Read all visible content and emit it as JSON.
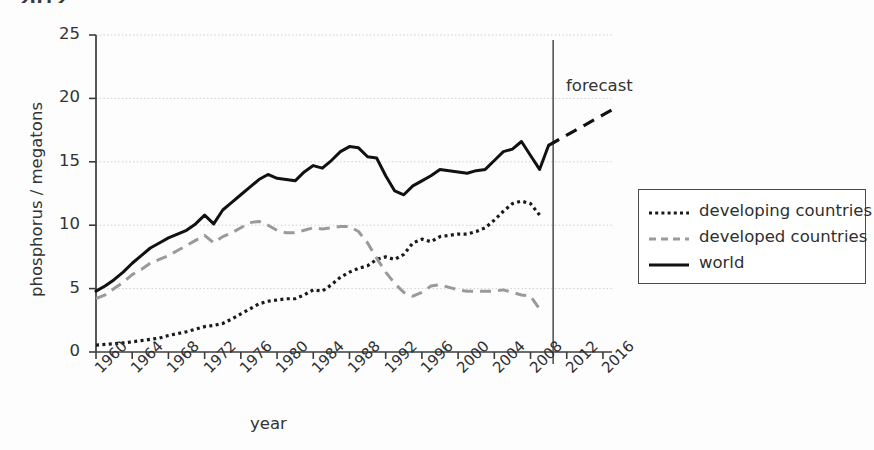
{
  "caption_fragment": "2012.",
  "legend": {
    "position": "right",
    "entries": [
      {
        "label": "developing countries",
        "style": "dotted",
        "color": "#1a1a1a"
      },
      {
        "label": "developed countries",
        "style": "dashed",
        "color": "#9a9a9a"
      },
      {
        "label": "world",
        "style": "solid",
        "color": "#111111"
      }
    ]
  },
  "annotations": [
    {
      "name": "forecast",
      "text": "forecast",
      "x_year": 2010.5
    }
  ],
  "chart_data": {
    "type": "line",
    "title": "",
    "xlabel": "year",
    "ylabel": "phosphorus / megatons",
    "xlim": [
      1960,
      2017
    ],
    "ylim": [
      0,
      25
    ],
    "yticks": [
      0,
      5,
      10,
      15,
      20,
      25
    ],
    "xticks": [
      1960,
      1964,
      1968,
      1972,
      1976,
      1980,
      1984,
      1988,
      1992,
      1996,
      2000,
      2004,
      2008,
      2012,
      2016
    ],
    "grid": "horizontal",
    "forecast_divider_year": 2010.5,
    "x": [
      1960,
      1961,
      1962,
      1963,
      1964,
      1965,
      1966,
      1967,
      1968,
      1969,
      1970,
      1971,
      1972,
      1973,
      1974,
      1975,
      1976,
      1977,
      1978,
      1979,
      1980,
      1981,
      1982,
      1983,
      1984,
      1985,
      1986,
      1987,
      1988,
      1989,
      1990,
      1991,
      1992,
      1993,
      1994,
      1995,
      1996,
      1997,
      1998,
      1999,
      2000,
      2001,
      2002,
      2003,
      2004,
      2005,
      2006,
      2007,
      2008,
      2009,
      2010
    ],
    "series": [
      {
        "name": "world",
        "style": "solid",
        "color": "#111111",
        "values": [
          4.8,
          5.2,
          5.7,
          6.3,
          7.0,
          7.6,
          8.2,
          8.6,
          9.0,
          9.3,
          9.6,
          10.1,
          10.8,
          10.1,
          11.2,
          11.8,
          12.4,
          13.0,
          13.6,
          14.0,
          13.7,
          13.6,
          13.5,
          14.2,
          14.7,
          14.5,
          15.1,
          15.8,
          16.2,
          16.1,
          15.4,
          15.3,
          13.9,
          12.7,
          12.4,
          13.1,
          13.5,
          13.9,
          14.4,
          14.3,
          14.2,
          14.1,
          14.3,
          14.4,
          15.1,
          15.8,
          16.0,
          16.6,
          15.5,
          14.4,
          16.3
        ],
        "forecast_x": [
          2010,
          2011,
          2012,
          2013,
          2014,
          2015,
          2016,
          2017
        ],
        "forecast_values": [
          16.3,
          16.7,
          17.1,
          17.5,
          17.9,
          18.3,
          18.7,
          19.1
        ]
      },
      {
        "name": "developed countries",
        "style": "dashed",
        "color": "#9a9a9a",
        "values": [
          4.2,
          4.5,
          5.0,
          5.5,
          6.1,
          6.5,
          7.0,
          7.3,
          7.6,
          8.0,
          8.4,
          8.8,
          9.2,
          8.6,
          9.1,
          9.4,
          9.8,
          10.2,
          10.3,
          10.0,
          9.6,
          9.4,
          9.4,
          9.6,
          9.8,
          9.7,
          9.8,
          9.9,
          9.9,
          9.5,
          8.6,
          7.4,
          6.3,
          5.4,
          4.7,
          4.4,
          4.7,
          5.2,
          5.3,
          5.1,
          4.9,
          4.8,
          4.8,
          4.8,
          4.8,
          4.9,
          4.7,
          4.5,
          4.4,
          3.4,
          null
        ]
      },
      {
        "name": "developing countries",
        "style": "dotted",
        "color": "#1a1a1a",
        "values": [
          0.55,
          0.6,
          0.65,
          0.72,
          0.8,
          0.9,
          1.0,
          1.1,
          1.3,
          1.45,
          1.6,
          1.8,
          2.0,
          2.1,
          2.25,
          2.6,
          3.0,
          3.4,
          3.8,
          4.0,
          4.1,
          4.2,
          4.2,
          4.5,
          4.9,
          4.8,
          5.3,
          5.9,
          6.3,
          6.6,
          6.8,
          7.3,
          7.5,
          7.3,
          7.7,
          8.6,
          8.9,
          8.7,
          9.1,
          9.2,
          9.3,
          9.3,
          9.5,
          9.8,
          10.4,
          11.1,
          11.7,
          11.9,
          11.7,
          10.8,
          null
        ]
      }
    ]
  }
}
